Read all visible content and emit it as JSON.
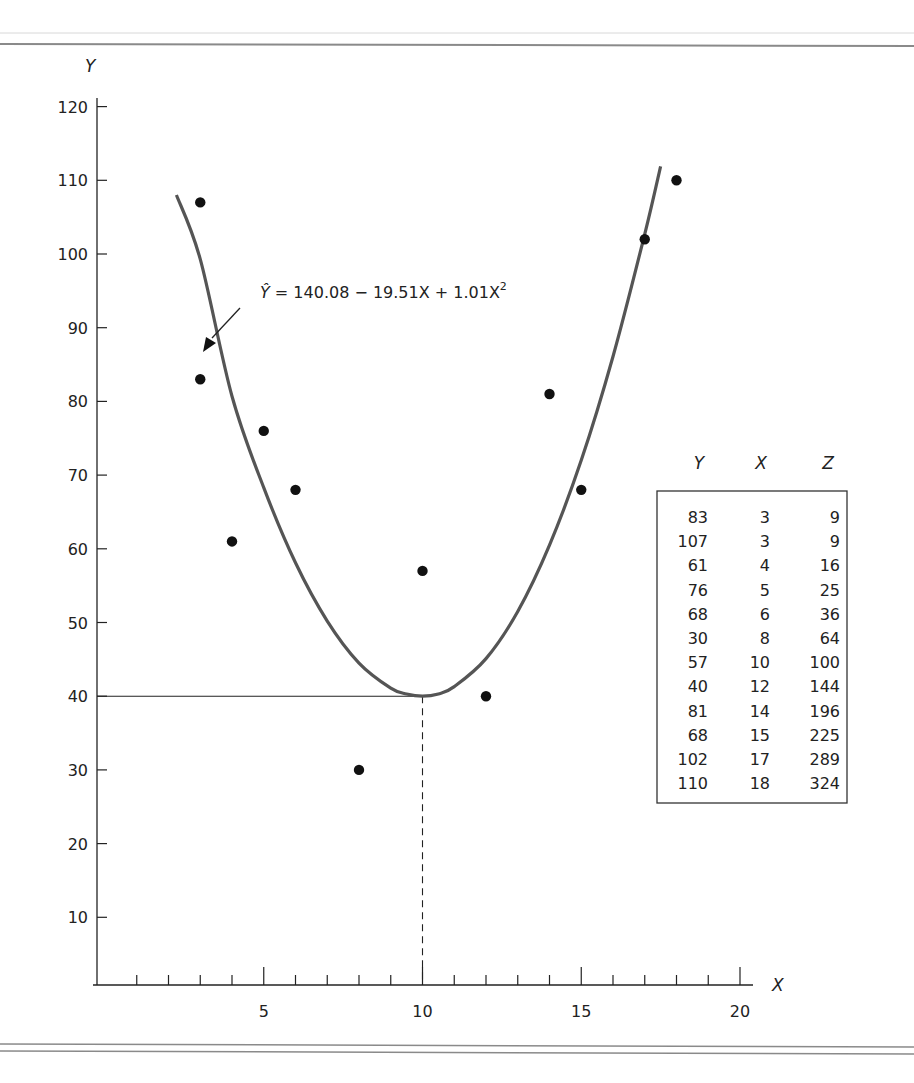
{
  "chart_data": {
    "type": "scatter",
    "title": "",
    "xlabel": "X",
    "ylabel": "Y",
    "xlim": [
      0,
      20
    ],
    "ylim": [
      0,
      120
    ],
    "grid": false,
    "x_ticks": [
      5,
      10,
      15,
      20
    ],
    "x_tick_labels": [
      "5",
      "10",
      "15",
      "20"
    ],
    "y_ticks": [
      10,
      20,
      30,
      40,
      50,
      60,
      70,
      80,
      90,
      100,
      110,
      120
    ],
    "y_tick_labels": [
      "10",
      "20",
      "30",
      "40",
      "50",
      "60",
      "70",
      "80",
      "90",
      "100",
      "110",
      "120"
    ],
    "series": [
      {
        "name": "observations",
        "kind": "scatter",
        "x": [
          3,
          3,
          4,
          5,
          6,
          8,
          10,
          12,
          14,
          15,
          17,
          18
        ],
        "y": [
          83,
          107,
          61,
          76,
          68,
          30,
          57,
          40,
          81,
          68,
          102,
          110
        ]
      },
      {
        "name": "fitted quadratic",
        "kind": "line",
        "equation": "Ŷ = 140.08 − 19.51X + 1.01X²",
        "x": [
          2.25,
          3,
          4,
          5,
          6,
          7,
          8,
          9,
          9.5,
          10,
          10.5,
          11,
          12,
          13,
          14,
          15,
          16,
          17,
          17.5
        ],
        "y": [
          108,
          99.3,
          80.7,
          68.3,
          58.1,
          50.2,
          44.5,
          41.1,
          40.3,
          40,
          40.3,
          41.3,
          45.1,
          51.5,
          60.5,
          72,
          86.1,
          102.7,
          111.9
        ]
      }
    ],
    "annotations": [
      {
        "type": "arrow-label",
        "text": "Ŷ = 140.08 − 19.51X + 1.01X²",
        "points_to": [
          3.1,
          87
        ]
      },
      {
        "type": "reference-line",
        "style": "solid",
        "description": "horizontal line at Y = 40 from Y axis to curve minimum",
        "y": 40,
        "x_to": 10
      },
      {
        "type": "reference-line",
        "style": "dashed",
        "description": "vertical line at X = 10 from curve minimum to X axis",
        "x": 10,
        "y_to": 40
      }
    ],
    "table": {
      "columns": [
        "Y",
        "X",
        "Z"
      ],
      "rows": [
        [
          83,
          3,
          9
        ],
        [
          107,
          3,
          9
        ],
        [
          61,
          4,
          16
        ],
        [
          76,
          5,
          25
        ],
        [
          68,
          6,
          36
        ],
        [
          30,
          8,
          64
        ],
        [
          57,
          10,
          100
        ],
        [
          40,
          12,
          144
        ],
        [
          81,
          14,
          196
        ],
        [
          68,
          15,
          225
        ],
        [
          102,
          17,
          289
        ],
        [
          110,
          18,
          324
        ]
      ]
    }
  },
  "labels": {
    "y_axis": "Y",
    "x_axis": "X",
    "equation_prefix": "Ŷ",
    "equation_body": " = 140.08 − 19.51X + 1.01X",
    "equation_exponent": "2"
  },
  "colors": {
    "curve": "#555555",
    "points": "#111111",
    "axes": "#222222",
    "rules": "#8a8a8a"
  }
}
